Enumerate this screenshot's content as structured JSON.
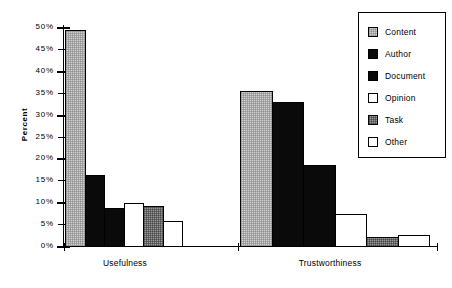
{
  "chart_data": {
    "type": "bar",
    "title": "",
    "xlabel": "",
    "ylabel": "Percent",
    "ylim": [
      0,
      50
    ],
    "ytick_labels": [
      "0%",
      "5%",
      "10%",
      "15%",
      "20%",
      "25%",
      "30%",
      "35%",
      "40%",
      "45%",
      "50%"
    ],
    "ytick_values": [
      0,
      5,
      10,
      15,
      20,
      25,
      30,
      35,
      40,
      45,
      50
    ],
    "grid": false,
    "legend_position": "top-right",
    "categories": [
      "Usefulness",
      "Trustworthiness"
    ],
    "series": [
      {
        "name": "Content",
        "values": [
          49.5,
          35.7
        ],
        "fill": "light-gray-stipple",
        "color": "#d2d2d2"
      },
      {
        "name": "Author",
        "values": [
          16.5,
          33.0
        ],
        "fill": "solid-black",
        "color": "#0a0a0a"
      },
      {
        "name": "Document",
        "values": [
          9.0,
          18.8
        ],
        "fill": "solid-black",
        "color": "#0a0a0a"
      },
      {
        "name": "Opinion",
        "values": [
          10.0,
          7.6
        ],
        "fill": "white",
        "color": "#ffffff"
      },
      {
        "name": "Task",
        "values": [
          9.3,
          2.2
        ],
        "fill": "gray-checker",
        "color": "#9a9a9a"
      },
      {
        "name": "Other",
        "values": [
          6.0,
          2.7
        ],
        "fill": "white",
        "color": "#ffffff"
      }
    ]
  },
  "axes": {
    "y_label": "Percent"
  },
  "legend": {
    "items": [
      {
        "label": "Content"
      },
      {
        "label": "Author"
      },
      {
        "label": "Document"
      },
      {
        "label": "Opinion"
      },
      {
        "label": "Task"
      },
      {
        "label": "Other"
      }
    ]
  }
}
